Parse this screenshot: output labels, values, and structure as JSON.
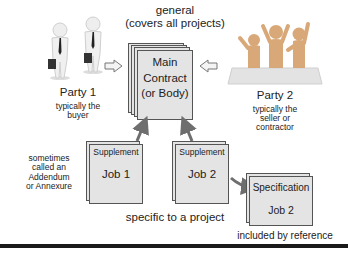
{
  "main_contract": {
    "top_label_line1": "general",
    "top_label_line2": "(covers all projects)",
    "line1": "Main",
    "line2": "Contract",
    "line3": "(or Body)"
  },
  "party1": {
    "name": "Party 1",
    "desc_line1": "typically the",
    "desc_line2": "buyer"
  },
  "party2": {
    "name": "Party 2",
    "desc_line1": "typically the",
    "desc_line2": "seller or",
    "desc_line3": "contractor"
  },
  "supplements": [
    {
      "header": "Supplement",
      "job": "Job 1"
    },
    {
      "header": "Supplement",
      "job": "Job 2"
    }
  ],
  "supplement_note": {
    "line1": "sometimes",
    "line2": "called an",
    "line3": "Addendum",
    "line4": "or Annexure"
  },
  "specific_label": "specific to a project",
  "specification": {
    "header": "Specification",
    "job": "Job 2",
    "caption": "included by reference"
  },
  "colors": {
    "doc_fill": "#e4e4e4",
    "doc_border": "#555555",
    "arrow_gray": "#6e6e6e",
    "figure_white": "#f2f2f2",
    "figure_orange": "#d9a878",
    "bottom_rule": "#1a1a1a"
  }
}
